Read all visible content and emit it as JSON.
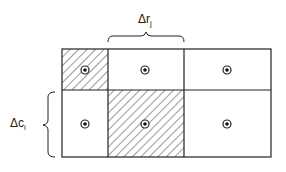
{
  "diagram": {
    "type": "grid-cells",
    "rows": 2,
    "columns": 3,
    "column_label": {
      "symbol": "Δr",
      "subscript": "j"
    },
    "row_label": {
      "symbol": "Δc",
      "subscript": "i"
    },
    "cells": [
      {
        "row": 0,
        "col": 0,
        "hatched": true,
        "center_marker": "circled-dot"
      },
      {
        "row": 0,
        "col": 1,
        "hatched": false,
        "center_marker": "circled-dot"
      },
      {
        "row": 0,
        "col": 2,
        "hatched": false,
        "center_marker": "circled-dot"
      },
      {
        "row": 1,
        "col": 0,
        "hatched": false,
        "center_marker": "circled-dot"
      },
      {
        "row": 1,
        "col": 1,
        "hatched": true,
        "center_marker": "circled-dot"
      },
      {
        "row": 1,
        "col": 2,
        "hatched": false,
        "center_marker": "circled-dot"
      }
    ],
    "colors": {
      "line": "#222222",
      "background": "#ffffff"
    }
  }
}
